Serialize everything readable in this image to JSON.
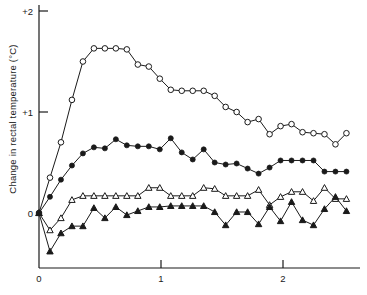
{
  "chart_data": {
    "type": "line",
    "title": "",
    "xlabel": "",
    "ylabel": "Change in rectal temperature (°C)",
    "xlim": [
      -0.03,
      2.62
    ],
    "ylim": [
      -0.45,
      2.08
    ],
    "xticks": [
      0,
      1,
      2
    ],
    "xticklabels": [
      "0",
      "1",
      "2"
    ],
    "yticks": [
      0,
      1,
      2
    ],
    "yticklabels": [
      "0",
      "+1",
      "+2"
    ],
    "grid": false,
    "legend": "none",
    "series": [
      {
        "name": "open-circle",
        "marker": "open-circle",
        "x": [
          0.0,
          0.09,
          0.18,
          0.27,
          0.36,
          0.45,
          0.54,
          0.63,
          0.72,
          0.81,
          0.9,
          0.99,
          1.08,
          1.17,
          1.26,
          1.35,
          1.44,
          1.53,
          1.62,
          1.71,
          1.8,
          1.89,
          1.98,
          2.07,
          2.16,
          2.25,
          2.34,
          2.43,
          2.52
        ],
        "y": [
          0.0,
          0.35,
          0.7,
          1.12,
          1.5,
          1.63,
          1.63,
          1.63,
          1.62,
          1.47,
          1.45,
          1.33,
          1.22,
          1.21,
          1.21,
          1.21,
          1.16,
          1.05,
          1.0,
          0.9,
          0.93,
          0.78,
          0.86,
          0.88,
          0.8,
          0.79,
          0.78,
          0.68,
          0.79
        ]
      },
      {
        "name": "filled-circle",
        "marker": "filled-circle",
        "x": [
          0.0,
          0.09,
          0.18,
          0.27,
          0.36,
          0.45,
          0.54,
          0.63,
          0.72,
          0.81,
          0.9,
          0.99,
          1.08,
          1.17,
          1.26,
          1.35,
          1.44,
          1.53,
          1.62,
          1.71,
          1.8,
          1.89,
          1.98,
          2.07,
          2.16,
          2.25,
          2.34,
          2.43,
          2.52
        ],
        "y": [
          0.0,
          0.16,
          0.33,
          0.47,
          0.59,
          0.65,
          0.64,
          0.73,
          0.67,
          0.66,
          0.66,
          0.63,
          0.74,
          0.6,
          0.53,
          0.63,
          0.5,
          0.48,
          0.49,
          0.44,
          0.39,
          0.45,
          0.52,
          0.52,
          0.52,
          0.52,
          0.41,
          0.41,
          0.41
        ]
      },
      {
        "name": "open-triangle",
        "marker": "open-triangle",
        "x": [
          0.0,
          0.09,
          0.18,
          0.27,
          0.36,
          0.45,
          0.54,
          0.63,
          0.72,
          0.81,
          0.9,
          0.99,
          1.08,
          1.17,
          1.26,
          1.35,
          1.44,
          1.53,
          1.62,
          1.71,
          1.8,
          1.89,
          1.98,
          2.07,
          2.16,
          2.25,
          2.34,
          2.43,
          2.52
        ],
        "y": [
          0.0,
          -0.17,
          -0.05,
          0.13,
          0.17,
          0.17,
          0.17,
          0.17,
          0.17,
          0.17,
          0.25,
          0.25,
          0.17,
          0.17,
          0.17,
          0.25,
          0.24,
          0.17,
          0.17,
          0.17,
          0.23,
          0.08,
          0.16,
          0.21,
          0.21,
          0.12,
          0.25,
          0.14,
          0.14
        ]
      },
      {
        "name": "filled-triangle",
        "marker": "filled-triangle",
        "x": [
          0.0,
          0.09,
          0.18,
          0.27,
          0.36,
          0.45,
          0.54,
          0.63,
          0.72,
          0.81,
          0.9,
          0.99,
          1.08,
          1.17,
          1.26,
          1.35,
          1.44,
          1.53,
          1.62,
          1.71,
          1.8,
          1.89,
          1.98,
          2.07,
          2.16,
          2.25,
          2.34,
          2.43,
          2.52
        ],
        "y": [
          0.0,
          -0.38,
          -0.2,
          -0.13,
          -0.13,
          0.05,
          -0.05,
          0.06,
          -0.02,
          0.02,
          0.06,
          0.06,
          0.07,
          0.07,
          0.07,
          0.07,
          0.01,
          -0.12,
          0.01,
          0.01,
          -0.11,
          0.06,
          -0.08,
          0.11,
          -0.07,
          -0.12,
          0.04,
          0.16,
          0.02
        ]
      }
    ]
  }
}
